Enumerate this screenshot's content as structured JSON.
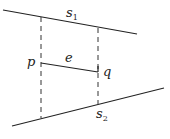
{
  "diagram": {
    "segments": [
      {
        "id": "s1",
        "label": "s",
        "subscript": "1",
        "x1": 3,
        "y1": 10,
        "x2": 137,
        "y2": 34,
        "style": "solid"
      },
      {
        "id": "s2",
        "label": "s",
        "subscript": "2",
        "x1": 12,
        "y1": 126,
        "x2": 164,
        "y2": 88,
        "style": "solid"
      },
      {
        "id": "e",
        "label": "e",
        "x1": 41,
        "y1": 63,
        "x2": 98,
        "y2": 72,
        "style": "solid"
      },
      {
        "id": "proj-p",
        "x1": 41,
        "y1": 17,
        "x2": 41,
        "y2": 118,
        "style": "dashed"
      },
      {
        "id": "proj-q",
        "x1": 98,
        "y1": 28,
        "x2": 98,
        "y2": 104,
        "style": "dashed"
      }
    ],
    "points": [
      {
        "id": "p",
        "label": "p"
      },
      {
        "id": "q",
        "label": "q"
      }
    ],
    "labels": {
      "s1_main": "s",
      "s1_sub": "1",
      "s2_main": "s",
      "s2_sub": "2",
      "e": "e",
      "p": "p",
      "q": "q"
    }
  }
}
